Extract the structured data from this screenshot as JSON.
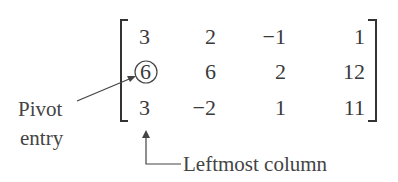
{
  "matrix": {
    "rows": [
      [
        "3",
        "2",
        "−1",
        "1"
      ],
      [
        "6",
        "6",
        "2",
        "12"
      ],
      [
        "3",
        "−2",
        "1",
        "11"
      ]
    ],
    "pivot": {
      "row": 1,
      "col": 0,
      "value": "6"
    }
  },
  "annotations": {
    "pivot_label_line1": "Pivot",
    "pivot_label_line2": "entry",
    "column_label": "Leftmost column"
  },
  "colors": {
    "ink": "#3a3a3a",
    "background": "#ffffff"
  }
}
